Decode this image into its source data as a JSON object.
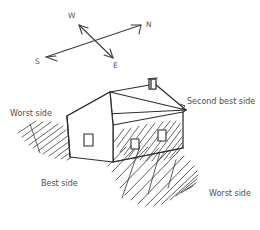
{
  "diagram": {
    "background_color": "#ffffff",
    "ink_color": "#3a3a3a",
    "text_color": "#4d4d4d"
  },
  "compass": {
    "name": "compass-rose",
    "description": "Two crossed double-headed arrows marking cardinal directions",
    "labels": {
      "west": "W",
      "north": "N",
      "south": "S",
      "east": "E"
    },
    "positions": {
      "west": {
        "x": 68,
        "y": 12
      },
      "north": {
        "x": 146,
        "y": 21
      },
      "south": {
        "x": 35,
        "y": 58
      },
      "east": {
        "x": 113,
        "y": 62
      }
    },
    "axes": [
      {
        "name": "west-east-axis",
        "from": "W",
        "to": "E",
        "from_point": [
          78,
          26
        ],
        "to_point": [
          112,
          57
        ]
      },
      {
        "name": "north-south-axis",
        "from": "N",
        "to": "S",
        "from_point": [
          141,
          25
        ],
        "to_point": [
          46,
          57
        ]
      }
    ]
  },
  "house": {
    "name": "house-sketch",
    "parts": [
      "roof",
      "ridge",
      "chimney",
      "front-gable-wall",
      "left-wall",
      "right-shaded-wall"
    ],
    "windows_count": 3,
    "chimney": {
      "name": "chimney",
      "x": 150,
      "y": 78
    }
  },
  "shadows": [
    {
      "name": "left-shadow-hatch",
      "side": "left"
    },
    {
      "name": "right-shadow-hatch",
      "side": "right"
    },
    {
      "name": "wall-shading-hatch",
      "side": "right-wall"
    }
  ],
  "side_labels": [
    {
      "name": "label-worst-side-left",
      "text": "Worst side",
      "x": 10,
      "y": 110
    },
    {
      "name": "label-second-best-side",
      "text": "Second best side",
      "x": 187,
      "y": 98
    },
    {
      "name": "label-best-side",
      "text": "Best side",
      "x": 41,
      "y": 180
    },
    {
      "name": "label-worst-side-right",
      "text": "Worst side",
      "x": 209,
      "y": 190
    }
  ]
}
